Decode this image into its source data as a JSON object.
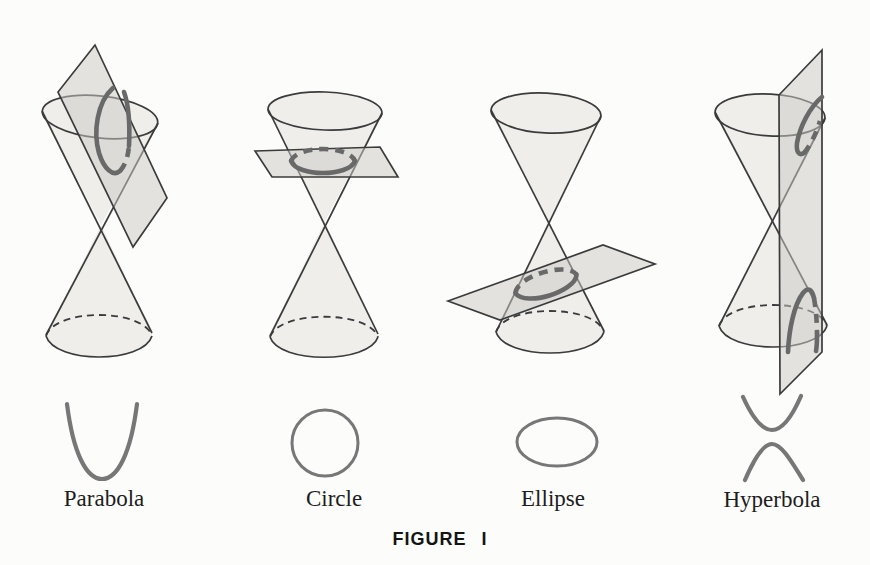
{
  "caption": "FIGURE I",
  "figures": [
    {
      "label": "Parabola",
      "icon": "parabola-curve-icon",
      "diagram": "double-cone-with-tilted-plane"
    },
    {
      "label": "Circle",
      "icon": "circle-curve-icon",
      "diagram": "double-cone-with-horizontal-plane"
    },
    {
      "label": "Ellipse",
      "icon": "ellipse-curve-icon",
      "diagram": "double-cone-with-slanted-plane"
    },
    {
      "label": "Hyperbola",
      "icon": "hyperbola-curve-icon",
      "diagram": "double-cone-with-vertical-plane"
    }
  ],
  "colors": {
    "background": "#fcfcfa",
    "cone_fill": "#efeeeb",
    "plane_fill": "#e5e4e1",
    "outline": "#3b3b3b",
    "section_curve": "#696969",
    "icon_curve": "#777777",
    "text": "#1d1d1d"
  }
}
